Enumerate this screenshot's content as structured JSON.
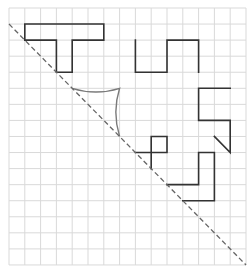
{
  "diagram": {
    "type": "grid-reflection",
    "grid": {
      "origin_px": [
        9,
        8
      ],
      "cell_w": 15.8,
      "cell_h": 16.06,
      "cols": 15,
      "rows": 16,
      "line_color": "#d9d9d9"
    },
    "mirror_line": {
      "style": "dashed",
      "from": [
        0,
        1
      ],
      "to": [
        15,
        16
      ],
      "color": "#666666"
    },
    "shapes": [
      {
        "name": "t-shape",
        "kind": "polyline",
        "closed": true,
        "points": [
          [
            1,
            1
          ],
          [
            6,
            1
          ],
          [
            6,
            2
          ],
          [
            4,
            2
          ],
          [
            4,
            4
          ],
          [
            3,
            4
          ],
          [
            3,
            2
          ],
          [
            1,
            2
          ]
        ]
      },
      {
        "name": "square-wave-shape",
        "kind": "polyline",
        "closed": false,
        "points": [
          [
            8,
            2
          ],
          [
            8,
            4
          ],
          [
            10,
            4
          ],
          [
            10,
            2
          ],
          [
            12,
            2
          ],
          [
            12,
            4
          ]
        ]
      },
      {
        "name": "right-hook-shape",
        "kind": "polyline",
        "closed": false,
        "points": [
          [
            14,
            5
          ],
          [
            12,
            5
          ],
          [
            12,
            7
          ],
          [
            14,
            7
          ],
          [
            14,
            9
          ],
          [
            13,
            8
          ]
        ]
      },
      {
        "name": "small-square-shape",
        "kind": "polyline",
        "closed": false,
        "points": [
          [
            8,
            9
          ],
          [
            10,
            9
          ],
          [
            10,
            8
          ],
          [
            9,
            8
          ],
          [
            9,
            10
          ]
        ]
      },
      {
        "name": "step-shape",
        "kind": "polyline",
        "closed": false,
        "points": [
          [
            10,
            11
          ],
          [
            12,
            11
          ],
          [
            12,
            9
          ],
          [
            13,
            9
          ],
          [
            13,
            12
          ],
          [
            11,
            12
          ]
        ]
      }
    ],
    "curved_shape": {
      "name": "concave-curved-triangle",
      "start": [
        4,
        5
      ],
      "corner": [
        7,
        5
      ],
      "end": [
        7,
        8
      ],
      "bow": 0.35,
      "color": "#7a7a7a"
    },
    "shape_color": "#333333"
  }
}
